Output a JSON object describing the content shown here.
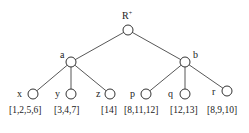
{
  "diagram": {
    "type": "tree",
    "root": {
      "id": "root",
      "label": "R",
      "superscript": "+"
    },
    "internal": [
      {
        "id": "a",
        "label": "a"
      },
      {
        "id": "b",
        "label": "b"
      }
    ],
    "leaves": [
      {
        "id": "x",
        "label": "x",
        "set": "[1,2,5,6]"
      },
      {
        "id": "y",
        "label": "y",
        "set": "[3,4,7]"
      },
      {
        "id": "z",
        "label": "z",
        "set": "[14]"
      },
      {
        "id": "p",
        "label": "p",
        "set": "[8,11,12]"
      },
      {
        "id": "q",
        "label": "q",
        "set": "[12,13]"
      },
      {
        "id": "r",
        "label": "r",
        "set": "[8,9,10]"
      }
    ],
    "edges": [
      [
        "root",
        "a"
      ],
      [
        "root",
        "b"
      ],
      [
        "a",
        "x"
      ],
      [
        "a",
        "y"
      ],
      [
        "a",
        "z"
      ],
      [
        "b",
        "p"
      ],
      [
        "b",
        "q"
      ],
      [
        "b",
        "r"
      ]
    ]
  }
}
